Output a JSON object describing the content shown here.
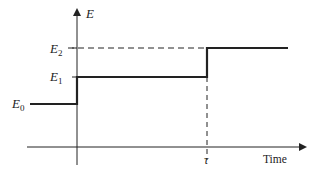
{
  "diagram": {
    "y_axis_label": "E",
    "x_axis_label": "Time",
    "levels": [
      {
        "name": "E0",
        "base": "E",
        "sub": "0"
      },
      {
        "name": "E1",
        "base": "E",
        "sub": "1"
      },
      {
        "name": "E2",
        "base": "E",
        "sub": "2"
      }
    ],
    "tau_label": "τ",
    "colors": {
      "line": "#222222",
      "background": "#ffffff"
    }
  }
}
